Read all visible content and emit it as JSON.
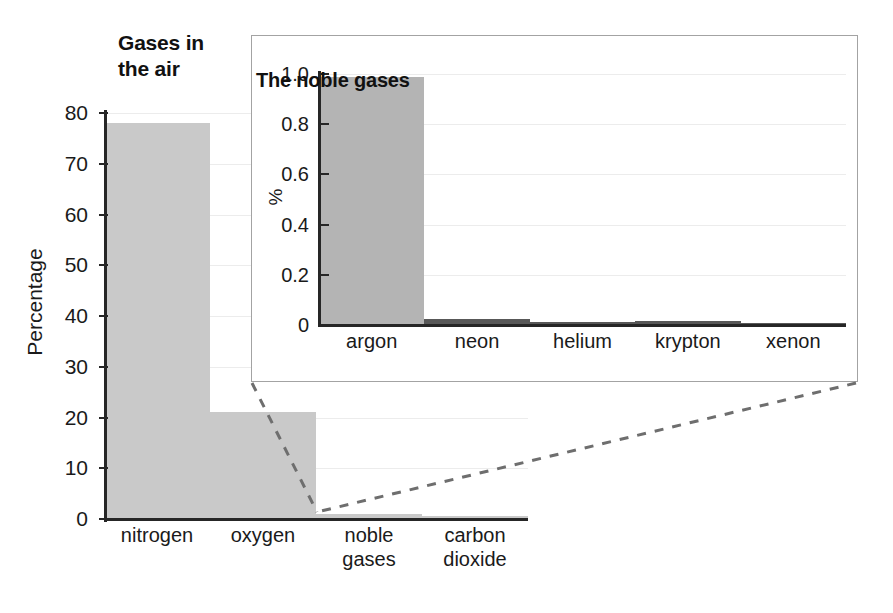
{
  "chart_data": [
    {
      "type": "bar",
      "id": "gases-in-the-air",
      "title": "Gases in\nthe air",
      "title_line1": "Gases in",
      "title_line2": "the air",
      "xlabel": "",
      "ylabel": "Percentage",
      "categories": [
        "nitrogen",
        "oxygen",
        "noble gases",
        "carbon dioxide"
      ],
      "category_lines": [
        [
          "nitrogen"
        ],
        [
          "oxygen"
        ],
        [
          "noble",
          "gases"
        ],
        [
          "carbon",
          "dioxide"
        ]
      ],
      "values": [
        78,
        21,
        1,
        0.04
      ],
      "ylim": [
        0,
        80
      ],
      "yticks": [
        0,
        10,
        20,
        30,
        40,
        50,
        60,
        70,
        80
      ],
      "ytick_labels": [
        "0",
        "10",
        "20",
        "30",
        "40",
        "50",
        "60",
        "70",
        "80"
      ],
      "grid": true,
      "legend": "none",
      "bar_color": "#c9c9c9"
    },
    {
      "type": "bar",
      "id": "the-noble-gases",
      "title": "The noble gases",
      "xlabel": "",
      "ylabel": "%",
      "categories": [
        "argon",
        "neon",
        "helium",
        "krypton",
        "xenon"
      ],
      "values": [
        0.99,
        0.0018,
        0.0005,
        0.0011,
        0.0001
      ],
      "ylim": [
        0,
        1.0
      ],
      "yticks": [
        0,
        0.2,
        0.4,
        0.6,
        0.8,
        1.0
      ],
      "ytick_labels": [
        "0",
        "0.2",
        "0.4",
        "0.6",
        "0.8",
        "1.0"
      ],
      "grid": true,
      "legend": "none",
      "bar_color": "#b4b4b4",
      "tiny_bar_color": "#585858"
    }
  ],
  "colors": {
    "axis": "#262626",
    "gridline": "#ececec",
    "inset_border": "#a3a3a3",
    "leader_line": "#6e6e6e",
    "main_bar": "#c9c9c9",
    "inset_bar": "#b4b4b4",
    "inset_tiny_bar": "#585858",
    "text": "#1a1a1a"
  }
}
